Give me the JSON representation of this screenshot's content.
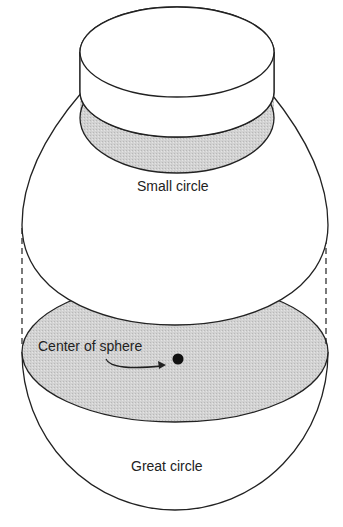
{
  "diagram": {
    "labels": {
      "small_circle": "Small circle",
      "center_of_sphere": "Center of sphere",
      "great_circle": "Great circle"
    },
    "colors": {
      "stroke": "#222222",
      "shade": "#cfcfcf",
      "background": "#ffffff"
    }
  }
}
